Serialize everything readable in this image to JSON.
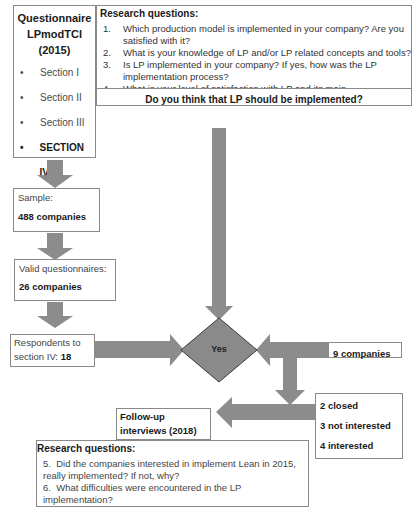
{
  "questionnaire": {
    "title_line1": "Questionnaire",
    "title_line2": "LPmodTCI (2015)",
    "sections": [
      {
        "bullet": "•",
        "label": "Section I",
        "bold": false
      },
      {
        "bullet": "•",
        "label": "Section II",
        "bold": false
      },
      {
        "bullet": "•",
        "label": "Section III",
        "bold": false
      },
      {
        "bullet": "•",
        "label": "SECTION IV",
        "bold": true
      },
      {
        "bullet": "•",
        "label": "Section V",
        "bold": false
      },
      {
        "bullet": "•",
        "label": "Section VI",
        "bold": false
      }
    ]
  },
  "research_questions_top": {
    "title": "Research questions:",
    "items": [
      {
        "num": "1.",
        "text": "Which production model is implemented in your company? Are you satisfied with it?"
      },
      {
        "num": "2.",
        "text": "What is your knowledge of LP and/or LP related concepts and tools?"
      },
      {
        "num": "3.",
        "text": "Is LP implemented in your company? If yes, how was the LP implementation process?"
      },
      {
        "num": "4.",
        "text": "What is your level of satisfaction with LP and its main understanding?"
      }
    ],
    "key_question": "Do you think that LP should be implemented?"
  },
  "sample": {
    "label": "Sample:",
    "value": "488 companies"
  },
  "valid": {
    "label": "Valid questionnaires:",
    "value": "26 companies"
  },
  "respondents": {
    "label": "Respondents to section IV:",
    "label_line1": "Respondents  to",
    "label_line2": "section IV: ",
    "value": "18"
  },
  "decision": {
    "label": "Yes"
  },
  "nine_companies": {
    "label": "9 companies"
  },
  "outcomes": {
    "items": [
      "2 closed",
      "3 not interested",
      "4 interested"
    ]
  },
  "followup": {
    "line1": "Follow-up",
    "line2": "interviews  (2018)"
  },
  "research_questions_bottom": {
    "title": "Research questions:",
    "items": [
      {
        "num": "5.",
        "text": "Did the companies interested in implement Lean in 2015, really implemented? If not, why?"
      },
      {
        "num": "6.",
        "text": "What difficulties were encountered in the LP implementation?"
      }
    ]
  },
  "colors": {
    "arrow": "#8c8c8c",
    "diamond": "#8a8a8a",
    "border": "#8a8a8a"
  }
}
